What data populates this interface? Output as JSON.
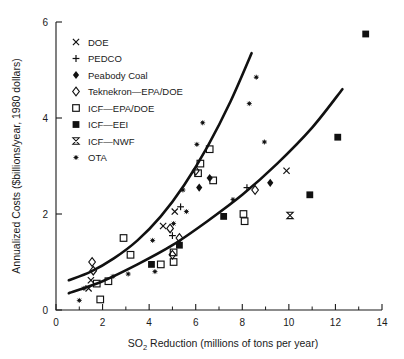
{
  "chart_data": {
    "type": "scatter",
    "title": "",
    "xlabel": "SO2 Reduction (millions of tons per year)",
    "xlabel_main": "SO",
    "xlabel_sub": "2",
    "xlabel_rest": " Reduction (millions of tons per year)",
    "ylabel": "Annualized Costs ($billions/year, 1980 dollars)",
    "xlim": [
      0,
      14
    ],
    "ylim": [
      0,
      6
    ],
    "xticks": [
      0,
      2,
      4,
      6,
      8,
      10,
      12,
      14
    ],
    "xticklabels": [
      "0",
      "2",
      "4",
      "6",
      "8",
      "10",
      "12",
      "14"
    ],
    "xminorticks": [
      1,
      3,
      5,
      7,
      9,
      11,
      13
    ],
    "yticks": [
      0,
      2,
      4,
      6
    ],
    "yticklabels": [
      "0",
      "2",
      "4",
      "6"
    ],
    "grid": false,
    "legend_position": "upper-left-inside",
    "legend": [
      {
        "label": "DOE",
        "marker": "x"
      },
      {
        "label": "PEDCO",
        "marker": "plus"
      },
      {
        "label": "Peabody Coal",
        "marker": "filled-diamond"
      },
      {
        "label": "Teknekron—EPA/DOE",
        "marker": "open-diamond"
      },
      {
        "label": "ICF—EPA/DOE",
        "marker": "open-square"
      },
      {
        "label": "ICF—EEI",
        "marker": "filled-square"
      },
      {
        "label": "ICF—NWF",
        "marker": "bowtie"
      },
      {
        "label": "OTA",
        "marker": "star"
      }
    ],
    "series": [
      {
        "name": "DOE",
        "marker": "x",
        "points": [
          [
            1.4,
            0.45
          ],
          [
            1.5,
            0.62
          ],
          [
            4.6,
            1.75
          ],
          [
            5.1,
            2.05
          ],
          [
            9.9,
            2.9
          ]
        ]
      },
      {
        "name": "PEDCO",
        "marker": "plus",
        "points": [
          [
            5.0,
            1.55
          ],
          [
            8.2,
            2.55
          ],
          [
            5.35,
            2.15
          ]
        ]
      },
      {
        "name": "Peabody Coal",
        "marker": "filled-diamond",
        "points": [
          [
            6.6,
            2.75
          ],
          [
            9.2,
            2.65
          ],
          [
            6.15,
            2.55
          ]
        ]
      },
      {
        "name": "Teknekron—EPA/DOE",
        "marker": "open-diamond",
        "points": [
          [
            1.55,
            1.0
          ],
          [
            1.6,
            0.82
          ],
          [
            4.9,
            1.7
          ],
          [
            5.3,
            1.5
          ],
          [
            8.55,
            2.5
          ],
          [
            6.0,
            2.9
          ],
          [
            5.0,
            1.15
          ]
        ]
      },
      {
        "name": "ICF—EPA/DOE",
        "marker": "open-square",
        "points": [
          [
            1.9,
            0.22
          ],
          [
            1.75,
            0.55
          ],
          [
            2.25,
            0.6
          ],
          [
            3.2,
            1.15
          ],
          [
            2.9,
            1.5
          ],
          [
            4.5,
            0.95
          ],
          [
            5.05,
            1.2
          ],
          [
            5.05,
            1.0
          ],
          [
            6.1,
            2.85
          ],
          [
            6.2,
            3.05
          ],
          [
            6.6,
            3.35
          ],
          [
            6.75,
            2.7
          ],
          [
            8.05,
            2.0
          ],
          [
            8.1,
            1.85
          ]
        ]
      },
      {
        "name": "ICF—EEI",
        "marker": "filled-square",
        "points": [
          [
            4.1,
            0.95
          ],
          [
            5.3,
            1.35
          ],
          [
            7.2,
            1.95
          ],
          [
            10.9,
            2.4
          ],
          [
            12.1,
            3.6
          ],
          [
            13.3,
            5.75
          ]
        ]
      },
      {
        "name": "ICF—NWF",
        "marker": "bowtie",
        "points": [
          [
            10.05,
            1.97
          ]
        ]
      },
      {
        "name": "OTA",
        "marker": "star",
        "points": [
          [
            1.0,
            0.2
          ],
          [
            1.2,
            0.45
          ],
          [
            2.45,
            0.7
          ],
          [
            3.1,
            0.75
          ],
          [
            4.15,
            1.45
          ],
          [
            4.25,
            0.8
          ],
          [
            5.05,
            1.8
          ],
          [
            5.6,
            2.05
          ],
          [
            5.45,
            2.5
          ],
          [
            6.05,
            3.45
          ],
          [
            6.3,
            3.9
          ],
          [
            7.6,
            2.3
          ],
          [
            8.3,
            4.3
          ],
          [
            8.6,
            4.85
          ],
          [
            8.95,
            3.5
          ]
        ]
      }
    ],
    "trend_curves": [
      {
        "name": "upper-bound-curve",
        "points": [
          [
            0.55,
            0.62
          ],
          [
            1.5,
            0.8
          ],
          [
            2.5,
            1.08
          ],
          [
            3.5,
            1.45
          ],
          [
            4.5,
            1.95
          ],
          [
            5.5,
            2.6
          ],
          [
            6.5,
            3.4
          ],
          [
            7.5,
            4.35
          ],
          [
            8.4,
            5.35
          ]
        ]
      },
      {
        "name": "lower-bound-curve",
        "points": [
          [
            0.55,
            0.35
          ],
          [
            2.0,
            0.6
          ],
          [
            3.5,
            0.95
          ],
          [
            5.0,
            1.35
          ],
          [
            6.5,
            1.85
          ],
          [
            8.0,
            2.4
          ],
          [
            9.5,
            3.05
          ],
          [
            11.0,
            3.8
          ],
          [
            12.3,
            4.6
          ]
        ]
      }
    ]
  }
}
